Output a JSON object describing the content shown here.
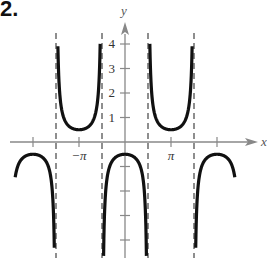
{
  "problem_number": "2.",
  "chart_data": {
    "type": "line",
    "title": "",
    "function_description": "y = -1/2 sec x",
    "xlabel": "x",
    "ylabel": "y",
    "x_ticks": [
      {
        "value": -6.2832,
        "label": ""
      },
      {
        "value": -3.1416,
        "label": "−π"
      },
      {
        "value": 3.1416,
        "label": "π"
      },
      {
        "value": 6.2832,
        "label": ""
      }
    ],
    "y_ticks": [
      {
        "value": 4,
        "label": "4"
      },
      {
        "value": 3,
        "label": "3"
      },
      {
        "value": 2,
        "label": "2"
      },
      {
        "value": 1,
        "label": "1"
      },
      {
        "value": -1,
        "label": ""
      },
      {
        "value": -2,
        "label": ""
      },
      {
        "value": -3,
        "label": ""
      },
      {
        "value": -4,
        "label": ""
      }
    ],
    "asymptotes_x": [
      -4.7124,
      -1.5708,
      1.5708,
      4.7124
    ],
    "branches": [
      {
        "x_range": [
          -7.5,
          -4.76
        ],
        "direction": "down",
        "vertex": [
          -6.2832,
          -0.5
        ]
      },
      {
        "x_range": [
          -4.66,
          -1.62
        ],
        "direction": "up",
        "vertex": [
          -3.1416,
          0.5
        ]
      },
      {
        "x_range": [
          -1.52,
          1.52
        ],
        "direction": "down",
        "vertex": [
          0,
          -0.5
        ]
      },
      {
        "x_range": [
          1.62,
          4.66
        ],
        "direction": "up",
        "vertex": [
          3.1416,
          0.5
        ]
      },
      {
        "x_range": [
          4.76,
          7.5
        ],
        "direction": "down",
        "vertex": [
          6.2832,
          -0.5
        ]
      }
    ],
    "xlim": [
      -7.9,
      8.9
    ],
    "ylim": [
      -4.7,
      4.6
    ],
    "grid": false,
    "legend": null,
    "colors": {
      "curve": "#111111",
      "axis": "#888888",
      "asymptote": "#444444"
    }
  }
}
